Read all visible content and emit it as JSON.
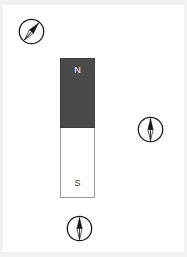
{
  "scene": {
    "title": "Bar magnet with three compasses",
    "background_color": "#ffffff",
    "width": 187,
    "height": 257
  },
  "magnet": {
    "name": "bar-magnet",
    "orientation": "vertical",
    "north_label": "N",
    "south_label": "S",
    "north_color": "#4a4a4a",
    "south_color": "#ffffff",
    "border_color": "#9b9b9b",
    "north_text_color": "#ffffff",
    "south_text_color": "#333333"
  },
  "compasses": [
    {
      "id": "compass-top-left",
      "position": "top-left",
      "needle_direction_degrees": 40,
      "needle_points": "up-right",
      "ring_color": "#1a1a1a",
      "needle_dark_color": "#111111",
      "needle_light_color": "#ffffff"
    },
    {
      "id": "compass-right",
      "position": "right-of-magnet",
      "needle_direction_degrees": 0,
      "needle_points": "up",
      "ring_color": "#1a1a1a",
      "needle_dark_color": "#111111",
      "needle_light_color": "#ffffff"
    },
    {
      "id": "compass-bottom",
      "position": "below-magnet",
      "needle_direction_degrees": 0,
      "needle_points": "up",
      "ring_color": "#1a1a1a",
      "needle_dark_color": "#111111",
      "needle_light_color": "#ffffff"
    }
  ]
}
